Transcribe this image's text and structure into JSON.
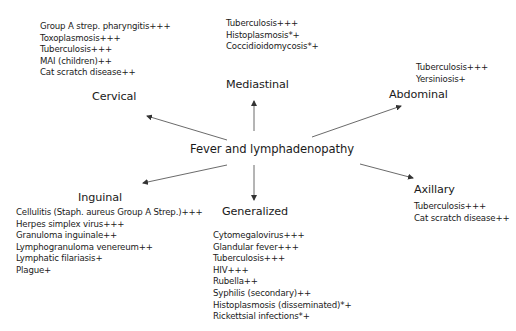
{
  "center": {
    "label": "Fever and lymphadenopathy"
  },
  "regions": {
    "cervical": {
      "label": "Cervical",
      "items": [
        "Group A  strep. pharyngitis+++",
        "Toxoplasmosis+++",
        "Tuberculosis+++",
        "MAI (children)++",
        "Cat scratch disease++"
      ]
    },
    "mediastinal": {
      "label": "Mediastinal",
      "items": [
        "Tuberculosis+++",
        "Histoplasmosis*+",
        "Coccidioidomycosis*+"
      ]
    },
    "abdominal": {
      "label": "Abdominal",
      "items": [
        "Tuberculosis+++",
        "Yersiniosis+"
      ]
    },
    "inguinal": {
      "label": "Inguinal",
      "items": [
        "Cellulitis (Staph. aureus Group A Strep.)+++",
        "Herpes simplex virus+++",
        "Granuloma inguinale++",
        "Lymphogranuloma venereum++",
        "Lymphatic filariasis+",
        "Plague+"
      ]
    },
    "generalized": {
      "label": "Generalized",
      "items": [
        "Cytomegalovirus+++",
        "Glandular fever+++",
        "Tuberculosis+++",
        "HIV+++",
        "Rubella++",
        "Syphilis  (secondary)++",
        "Histoplasmosis (disseminated)*+",
        "Rickettsial infections*+"
      ]
    },
    "axillary": {
      "label": "Axillary",
      "items": [
        "Tuberculosis+++",
        "Cat scratch disease++"
      ]
    }
  },
  "colors": {
    "text": "#1a1a1a",
    "arrow": "#333333",
    "background": "#ffffff"
  }
}
